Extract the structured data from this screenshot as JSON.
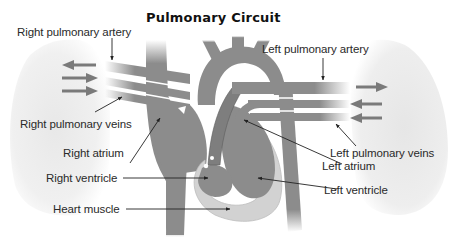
{
  "title": "Pulmonary Circuit",
  "labels": {
    "right_pulmonary_artery": "Right pulmonary artery",
    "left_pulmonary_artery": "Left pulmonary artery",
    "right_pulmonary_veins": "Right pulmonary veins",
    "left_pulmonary_veins": "Left pulmonary veins",
    "right_atrium": "Right atrium",
    "left_atrium": "Left atrium",
    "right_ventricle": "Right ventricle",
    "left_ventricle": "Left ventricle",
    "heart_muscle": "Heart muscle"
  },
  "colors": {
    "vessel": "#8c8c8c",
    "vessel_dark": "#6e6e6e",
    "muscle": "#d4d4d4",
    "lung": "#ececec",
    "arrow": "#707070",
    "text": "#2a2a2a",
    "background": "#ffffff"
  }
}
